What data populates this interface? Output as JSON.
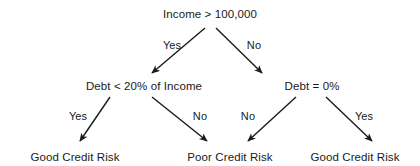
{
  "diagram": {
    "type": "decision-tree",
    "title_visible": false,
    "background_color": "#ffffff",
    "ink_color": "#1a1a1a",
    "nodes": [
      {
        "id": "root",
        "label": "Income > 100,000",
        "x": 210,
        "y": 14,
        "level": 0,
        "kind": "decision"
      },
      {
        "id": "debt20",
        "label": "Debt < 20% of Income",
        "x": 144,
        "y": 86,
        "level": 1,
        "kind": "decision"
      },
      {
        "id": "debt0",
        "label": "Debt = 0%",
        "x": 312,
        "y": 86,
        "level": 1,
        "kind": "decision"
      },
      {
        "id": "leaf_left",
        "label": "Good Credit Risk",
        "x": 75,
        "y": 157,
        "level": 2,
        "kind": "outcome"
      },
      {
        "id": "leaf_mid",
        "label": "Poor Credit Risk",
        "x": 230,
        "y": 157,
        "level": 2,
        "kind": "outcome"
      },
      {
        "id": "leaf_right",
        "label": "Good Credit Risk",
        "x": 355,
        "y": 157,
        "level": 2,
        "kind": "outcome"
      }
    ],
    "edges": [
      {
        "id": "e1",
        "from": "root",
        "to": "debt20",
        "label": "Yes",
        "x1": 205,
        "y1": 28,
        "x2": 152,
        "y2": 73,
        "lx": 172,
        "ly": 45
      },
      {
        "id": "e2",
        "from": "root",
        "to": "debt0",
        "label": "No",
        "x1": 216,
        "y1": 28,
        "x2": 262,
        "y2": 73,
        "lx": 254,
        "ly": 45
      },
      {
        "id": "e3",
        "from": "debt20",
        "to": "leaf_left",
        "label": "Yes",
        "x1": 110,
        "y1": 97,
        "x2": 80,
        "y2": 141,
        "lx": 78,
        "ly": 116
      },
      {
        "id": "e4",
        "from": "debt20",
        "to": "leaf_mid",
        "label": "No",
        "x1": 152,
        "y1": 97,
        "x2": 207,
        "y2": 141,
        "lx": 200,
        "ly": 116
      },
      {
        "id": "e5",
        "from": "debt0",
        "to": "leaf_mid",
        "label": "No",
        "x1": 296,
        "y1": 97,
        "x2": 248,
        "y2": 141,
        "lx": 248,
        "ly": 116
      },
      {
        "id": "e6",
        "from": "debt0",
        "to": "leaf_right",
        "label": "Yes",
        "x1": 326,
        "y1": 97,
        "x2": 372,
        "y2": 141,
        "lx": 364,
        "ly": 116
      }
    ]
  }
}
